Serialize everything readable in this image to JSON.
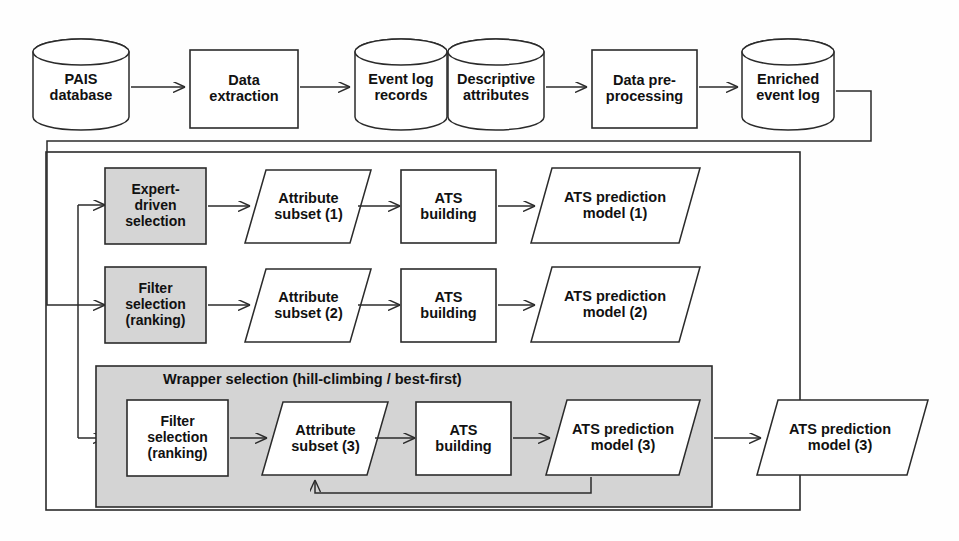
{
  "diagram": {
    "colors": {
      "stroke": "#2b2b2b",
      "fill_white": "#ffffff",
      "fill_gray": "#d5d5d5",
      "fill_panel_gray": "#d4d4d4",
      "text": "#111111",
      "background": "#fefefe"
    },
    "pipeline": {
      "nodes": [
        {
          "id": "pais-database",
          "shape": "cylinder",
          "fill": "white",
          "label": "PAIS\ndatabase",
          "lines": [
            "PAIS",
            "database"
          ]
        },
        {
          "id": "data-extraction",
          "shape": "rectangle",
          "fill": "white",
          "label": "Data\nextraction",
          "lines": [
            "Data",
            "extraction"
          ]
        },
        {
          "id": "event-log-records",
          "shape": "cylinder",
          "fill": "white",
          "label": "Event log\nrecords",
          "lines": [
            "Event log",
            "records"
          ]
        },
        {
          "id": "descriptive-attributes",
          "shape": "cylinder",
          "fill": "white",
          "label": "Descriptive\nattributes",
          "lines": [
            "Descriptive",
            "attributes"
          ]
        },
        {
          "id": "data-preprocessing",
          "shape": "rectangle",
          "fill": "white",
          "label": "Data pre-\nprocessing",
          "lines": [
            "Data pre-",
            "processing"
          ]
        },
        {
          "id": "enriched-event-log",
          "shape": "cylinder",
          "fill": "white",
          "label": "Enriched\nevent log",
          "lines": [
            "Enriched",
            "event log"
          ]
        }
      ]
    },
    "branches": [
      {
        "id": "expert-driven-branch",
        "selection": {
          "id": "expert-driven-selection",
          "shape": "rectangle",
          "fill": "gray",
          "lines": [
            "Expert-",
            "driven",
            "selection"
          ]
        },
        "subset": {
          "id": "attribute-subset-1",
          "shape": "parallelogram",
          "fill": "white",
          "lines": [
            "Attribute",
            "subset (1)"
          ]
        },
        "building": {
          "id": "ats-building-1",
          "shape": "rectangle",
          "fill": "white",
          "lines": [
            "ATS",
            "building"
          ]
        },
        "model": {
          "id": "ats-prediction-model-1",
          "shape": "parallelogram",
          "fill": "white",
          "lines": [
            "ATS prediction",
            "model (1)"
          ]
        }
      },
      {
        "id": "filter-branch",
        "selection": {
          "id": "filter-selection-ranking-2",
          "shape": "rectangle",
          "fill": "gray",
          "lines": [
            "Filter",
            "selection",
            "(ranking)"
          ]
        },
        "subset": {
          "id": "attribute-subset-2",
          "shape": "parallelogram",
          "fill": "white",
          "lines": [
            "Attribute",
            "subset (2)"
          ]
        },
        "building": {
          "id": "ats-building-2",
          "shape": "rectangle",
          "fill": "white",
          "lines": [
            "ATS",
            "building"
          ]
        },
        "model": {
          "id": "ats-prediction-model-2",
          "shape": "parallelogram",
          "fill": "white",
          "lines": [
            "ATS prediction",
            "model (2)"
          ]
        }
      },
      {
        "id": "wrapper-branch",
        "panel_label": "Wrapper selection (hill-climbing / best-first)",
        "selection": {
          "id": "filter-selection-ranking-3",
          "shape": "rectangle",
          "fill": "white",
          "lines": [
            "Filter",
            "selection",
            "(ranking)"
          ]
        },
        "subset": {
          "id": "attribute-subset-3",
          "shape": "parallelogram",
          "fill": "white",
          "lines": [
            "Attribute",
            "subset (3)"
          ]
        },
        "building": {
          "id": "ats-building-3",
          "shape": "rectangle",
          "fill": "white",
          "lines": [
            "ATS",
            "building"
          ]
        },
        "model": {
          "id": "ats-prediction-model-3-inner",
          "shape": "parallelogram",
          "fill": "white",
          "lines": [
            "ATS prediction",
            "model (3)"
          ]
        },
        "output": {
          "id": "ats-prediction-model-3-output",
          "shape": "parallelogram",
          "fill": "white",
          "lines": [
            "ATS prediction",
            "model (3)"
          ]
        }
      }
    ],
    "labels": {
      "pais_l1": "PAIS",
      "pais_l2": "database",
      "extract_l1": "Data",
      "extract_l2": "extraction",
      "eventlog_l1": "Event log",
      "eventlog_l2": "records",
      "descr_l1": "Descriptive",
      "descr_l2": "attributes",
      "prep_l1": "Data pre-",
      "prep_l2": "processing",
      "enriched_l1": "Enriched",
      "enriched_l2": "event log",
      "expert_l1": "Expert-",
      "expert_l2": "driven",
      "expert_l3": "selection",
      "filter2_l1": "Filter",
      "filter2_l2": "selection",
      "filter2_l3": "(ranking)",
      "filter3_l1": "Filter",
      "filter3_l2": "selection",
      "filter3_l3": "(ranking)",
      "subset1_l1": "Attribute",
      "subset1_l2": "subset (1)",
      "subset2_l1": "Attribute",
      "subset2_l2": "subset (2)",
      "subset3_l1": "Attribute",
      "subset3_l2": "subset (3)",
      "ats1_l1": "ATS",
      "ats1_l2": "building",
      "ats2_l1": "ATS",
      "ats2_l2": "building",
      "ats3_l1": "ATS",
      "ats3_l2": "building",
      "model1_l1": "ATS prediction",
      "model1_l2": "model (1)",
      "model2_l1": "ATS prediction",
      "model2_l2": "model (2)",
      "model3_l1": "ATS prediction",
      "model3_l2": "model (3)",
      "model3out_l1": "ATS prediction",
      "model3out_l2": "model (3)",
      "wrapper_panel": "Wrapper selection (hill-climbing / best-first)"
    }
  }
}
